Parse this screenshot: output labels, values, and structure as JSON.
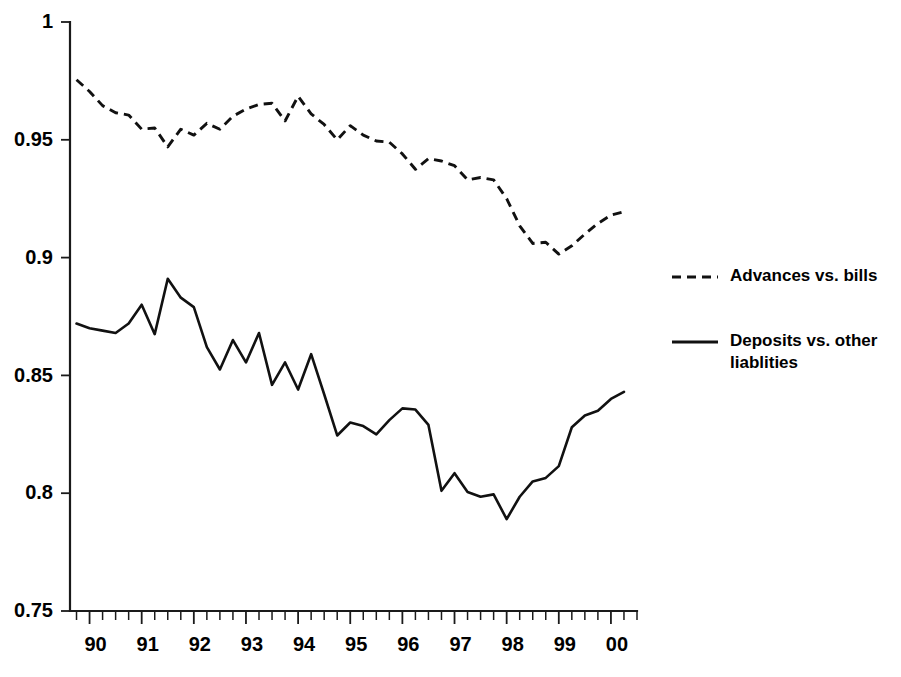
{
  "chart_data": {
    "type": "line",
    "title": "",
    "subtitle": "",
    "xlabel": "",
    "ylabel": "",
    "xlim": [
      1989.625,
      2000.5
    ],
    "ylim": [
      0.75,
      1.0
    ],
    "grid": false,
    "legend_position": "right",
    "y_ticks": [
      "0.75",
      "0.8",
      "0.85",
      "0.9",
      "0.95",
      "1"
    ],
    "y_tick_values": [
      0.75,
      0.8,
      0.85,
      0.9,
      0.95,
      1.0
    ],
    "x_tick_labels": [
      "90",
      "91",
      "92",
      "93",
      "94",
      "95",
      "96",
      "97",
      "98",
      "99",
      "00"
    ],
    "x_tick_values": [
      1990,
      1991,
      1992,
      1993,
      1994,
      1995,
      1996,
      1997,
      1998,
      1999,
      2000
    ],
    "x_minor_ticks_per_year": 4,
    "x": [
      1989.75,
      1990.0,
      1990.25,
      1990.5,
      1990.75,
      1991.0,
      1991.25,
      1991.5,
      1991.75,
      1992.0,
      1992.25,
      1992.5,
      1992.75,
      1993.0,
      1993.25,
      1993.5,
      1993.75,
      1994.0,
      1994.25,
      1994.5,
      1994.75,
      1995.0,
      1995.25,
      1995.5,
      1995.75,
      1996.0,
      1996.25,
      1996.5,
      1996.75,
      1997.0,
      1997.25,
      1997.5,
      1997.75,
      1998.0,
      1998.25,
      1998.5,
      1998.75,
      1999.0,
      1999.25,
      1999.5,
      1999.75,
      2000.0,
      2000.25
    ],
    "series": [
      {
        "name": "Advances vs. bills",
        "style": "dashed",
        "color": "#111111",
        "values": [
          0.9755,
          0.9705,
          0.9645,
          0.9615,
          0.9605,
          0.9545,
          0.955,
          0.947,
          0.9545,
          0.952,
          0.957,
          0.9545,
          0.96,
          0.963,
          0.965,
          0.9655,
          0.958,
          0.9685,
          0.961,
          0.9565,
          0.95,
          0.956,
          0.952,
          0.9495,
          0.949,
          0.944,
          0.9375,
          0.942,
          0.941,
          0.939,
          0.933,
          0.934,
          0.933,
          0.925,
          0.9135,
          0.906,
          0.9065,
          0.9015,
          0.905,
          0.91,
          0.9145,
          0.918,
          0.9195
        ]
      },
      {
        "name": "Deposits vs. other liablities",
        "style": "solid",
        "color": "#111111",
        "values": [
          0.872,
          0.87,
          0.869,
          0.868,
          0.872,
          0.88,
          0.8675,
          0.891,
          0.883,
          0.879,
          0.862,
          0.8525,
          0.865,
          0.8555,
          0.868,
          0.846,
          0.8555,
          0.844,
          0.859,
          0.842,
          0.8245,
          0.83,
          0.8285,
          0.825,
          0.831,
          0.836,
          0.8355,
          0.829,
          0.801,
          0.8085,
          0.8005,
          0.7985,
          0.7995,
          0.789,
          0.7985,
          0.805,
          0.8065,
          0.8115,
          0.828,
          0.833,
          0.835,
          0.84,
          0.843
        ]
      }
    ]
  },
  "legend": {
    "entries": [
      {
        "label": "Advances vs. bills",
        "style": "dashed"
      },
      {
        "label_line1": "Deposits vs. other",
        "label_line2": "liablities",
        "style": "solid"
      }
    ]
  }
}
